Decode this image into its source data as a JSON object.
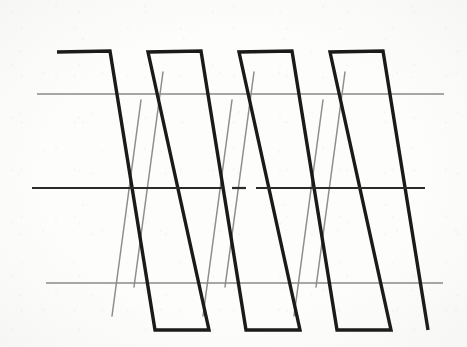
{
  "figure": {
    "kind": "oscilloscope-trace-diagram",
    "background_color": "#fdfdfc",
    "width": 467,
    "height": 347
  },
  "colors": {
    "primary_trace": "#1a1a1a",
    "secondary_trace": "#8e8e8e",
    "graticule_light": "#8a8a8a",
    "graticule_dark": "#2b2b2b",
    "background": "#fdfdfc"
  },
  "chart_data": {
    "type": "line",
    "xlabel": "",
    "ylabel": "",
    "xlim": [
      0,
      467
    ],
    "ylim": [
      347,
      0
    ],
    "grid": true,
    "legend": "none",
    "axes_visible": false,
    "tick_labels_x": [],
    "tick_labels_y": [],
    "graticule_lines": [
      {
        "name": "upper-baseline",
        "y": 94,
        "x_start": 37,
        "x_end": 444,
        "weight": 1.3,
        "color": "#8a8a8a"
      },
      {
        "name": "center-baseline",
        "y": 188,
        "x_start": 32,
        "x_end": 425,
        "weight": 2.2,
        "color": "#2b2b2b",
        "gap_start": 223,
        "gap_end": 232,
        "gap2_start": 246,
        "gap2_end": 256
      },
      {
        "name": "lower-baseline",
        "y": 283,
        "x_start": 46,
        "x_end": 443,
        "weight": 1.3,
        "color": "#8a8a8a"
      }
    ],
    "series": [
      {
        "name": "primary-sawtooth",
        "color": "#1a1a1a",
        "weight": 3.4,
        "style": "solid",
        "description": "Bold trapezoidal sawtooth: flat top, steep fall, flat bottom, steep rise; 4 cycles left to right with rightward skew",
        "points": [
          [
            57,
            52
          ],
          [
            110,
            51
          ],
          [
            155,
            330
          ],
          [
            209,
            330
          ],
          [
            148,
            52
          ],
          [
            201,
            51
          ],
          [
            246,
            330
          ],
          [
            300,
            330
          ],
          [
            239,
            52
          ],
          [
            292,
            51
          ],
          [
            337,
            330
          ],
          [
            391,
            330
          ],
          [
            330,
            52
          ],
          [
            383,
            51
          ],
          [
            428,
            330
          ]
        ],
        "segments": [
          {
            "from": [
              57,
              52
            ],
            "to": [
              110,
              51
            ],
            "kind": "flat-top"
          },
          {
            "from": [
              110,
              51
            ],
            "to": [
              155,
              330
            ],
            "kind": "falling-edge"
          },
          {
            "from": [
              155,
              330
            ],
            "to": [
              209,
              330
            ],
            "kind": "flat-bottom"
          },
          {
            "from": [
              209,
              330
            ],
            "to": [
              148,
              52
            ],
            "kind": "rising-retrace"
          },
          {
            "from": [
              148,
              52
            ],
            "to": [
              201,
              51
            ],
            "kind": "flat-top"
          },
          {
            "from": [
              201,
              51
            ],
            "to": [
              246,
              330
            ],
            "kind": "falling-edge"
          },
          {
            "from": [
              246,
              330
            ],
            "to": [
              300,
              330
            ],
            "kind": "flat-bottom"
          },
          {
            "from": [
              300,
              330
            ],
            "to": [
              239,
              52
            ],
            "kind": "rising-retrace"
          },
          {
            "from": [
              239,
              52
            ],
            "to": [
              292,
              51
            ],
            "kind": "flat-top"
          },
          {
            "from": [
              292,
              51
            ],
            "to": [
              337,
              330
            ],
            "kind": "falling-edge"
          },
          {
            "from": [
              337,
              330
            ],
            "to": [
              391,
              330
            ],
            "kind": "flat-bottom"
          },
          {
            "from": [
              391,
              330
            ],
            "to": [
              330,
              52
            ],
            "kind": "rising-retrace"
          },
          {
            "from": [
              330,
              52
            ],
            "to": [
              383,
              51
            ],
            "kind": "flat-top"
          },
          {
            "from": [
              383,
              51
            ],
            "to": [
              428,
              330
            ],
            "kind": "falling-edge"
          }
        ]
      },
      {
        "name": "secondary-sawtooth",
        "color": "#8e8e8e",
        "weight": 1.5,
        "style": "solid",
        "description": "Thin grey retrace lines rising left-to-right, clipped between the upper and lower baselines",
        "segments": [
          {
            "from": [
              163,
              285
            ],
            "to": [
              141,
              100
            ],
            "kind": "rising-retrace"
          },
          {
            "from": [
              254,
              285
            ],
            "to": [
              232,
              100
            ],
            "kind": "rising-retrace"
          },
          {
            "from": [
              345,
              285
            ],
            "to": [
              323,
              100
            ],
            "kind": "rising-retrace"
          },
          {
            "from": [
              112,
              313
            ],
            "to": [
              141,
              100
            ],
            "kind": "rising-retrace-ext"
          },
          {
            "from": [
              203,
              313
            ],
            "to": [
              232,
              100
            ],
            "kind": "rising-retrace-ext"
          },
          {
            "from": [
              294,
              313
            ],
            "to": [
              323,
              100
            ],
            "kind": "rising-retrace-ext"
          }
        ]
      }
    ],
    "annotations": [
      {
        "name": "center-line-break",
        "x": 228,
        "y": 188,
        "text": ""
      }
    ]
  }
}
